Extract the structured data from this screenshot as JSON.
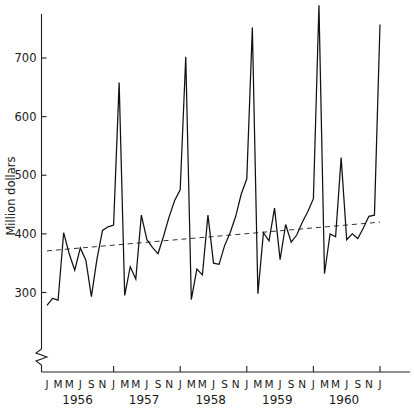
{
  "chart_data": {
    "type": "line",
    "title": "",
    "subtitle": "",
    "xlabel": "",
    "ylabel": "Million dollars",
    "ylim": [
      255,
      800
    ],
    "xlim": [
      0,
      61
    ],
    "grid": false,
    "legend": null,
    "y_axis_break": true,
    "y_ticks": [
      300,
      400,
      500,
      600,
      700
    ],
    "y_tick_labels": [
      "300",
      "400",
      "500",
      "600",
      "700"
    ],
    "x_tick_labels": [
      "J",
      "M",
      "M",
      "J",
      "S",
      "N",
      "J",
      "M",
      "M",
      "J",
      "S",
      "N",
      "J",
      "M",
      "M",
      "J",
      "S",
      "N",
      "J",
      "M",
      "M",
      "J",
      "S",
      "N",
      "J",
      "M",
      "M",
      "J",
      "S",
      "N",
      "J"
    ],
    "year_labels": [
      "1956",
      "1957",
      "1958",
      "1959",
      "1960"
    ],
    "series": [
      {
        "name": "Monthly sales",
        "style": "solid",
        "x": [
          0,
          1,
          2,
          3,
          4,
          5,
          6,
          7,
          8,
          9,
          10,
          11,
          12,
          13,
          14,
          15,
          16,
          17,
          18,
          19,
          20,
          21,
          22,
          23,
          24,
          25,
          26,
          27,
          28,
          29,
          30,
          31,
          32,
          33,
          34,
          35,
          36,
          37,
          38,
          39,
          40,
          41,
          42,
          43,
          44,
          45,
          46,
          47,
          48,
          49,
          50,
          51,
          52,
          53,
          54,
          55,
          56,
          57,
          58,
          59,
          60
        ],
        "values": [
          278,
          290,
          287,
          402,
          366,
          338,
          376,
          355,
          293,
          357,
          406,
          412,
          415,
          658,
          295,
          344,
          323,
          432,
          390,
          377,
          366,
          396,
          429,
          457,
          475,
          702,
          288,
          340,
          330,
          432,
          350,
          348,
          380,
          402,
          430,
          468,
          494,
          752,
          298,
          402,
          388,
          444,
          356,
          416,
          386,
          398,
          420,
          438,
          460,
          790,
          332,
          400,
          395,
          530,
          390,
          400,
          392,
          410,
          430,
          432,
          757
        ]
      },
      {
        "name": "Trend",
        "style": "dashed",
        "x": [
          0,
          60
        ],
        "values": [
          371,
          420
        ]
      }
    ]
  },
  "axis": {
    "ylabel": "Million dollars"
  }
}
